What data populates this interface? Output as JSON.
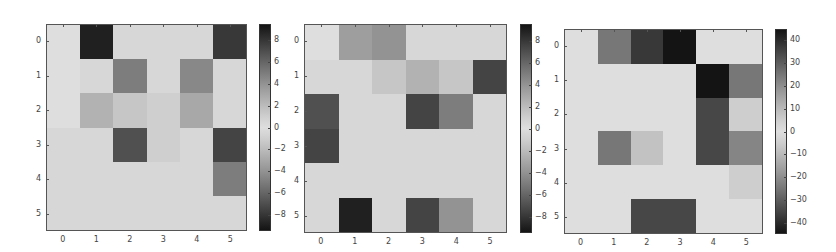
{
  "chart_data": [
    {
      "type": "heatmap",
      "title": "",
      "xlabel": "",
      "ylabel": "",
      "x_ticks": [
        "0",
        "1",
        "2",
        "3",
        "4",
        "5"
      ],
      "y_ticks": [
        "0",
        "1",
        "2",
        "3",
        "4",
        "5"
      ],
      "colormap": "diverging gray (dark at extremes, light near zero)",
      "vmin": -9.5,
      "vmax": 9.5,
      "colorbar_ticks": [
        8,
        6,
        4,
        2,
        0,
        -2,
        -4,
        -6,
        -8
      ],
      "values": [
        [
          0,
          9,
          0.5,
          0.5,
          0.5,
          8
        ],
        [
          0,
          0.5,
          5,
          0.5,
          4.5,
          0.5
        ],
        [
          0,
          2.5,
          1.5,
          1,
          3,
          0.5
        ],
        [
          0.5,
          0.5,
          7,
          1,
          0.5,
          7.5
        ],
        [
          0.5,
          0.5,
          0.5,
          0.5,
          0.5,
          5
        ],
        [
          0.5,
          0.5,
          0.5,
          0.5,
          0.5,
          0.5
        ]
      ],
      "frame": {
        "x": 46,
        "y": 24,
        "w": 201,
        "h": 207
      },
      "colorbar": {
        "x": 259,
        "y": 24,
        "w": 12,
        "h": 207
      }
    },
    {
      "type": "heatmap",
      "title": "",
      "xlabel": "",
      "ylabel": "",
      "x_ticks": [
        "0",
        "1",
        "2",
        "3",
        "4",
        "5"
      ],
      "y_ticks": [
        "0",
        "1",
        "2",
        "3",
        "4",
        "5"
      ],
      "colormap": "diverging gray (dark at extremes, light near zero)",
      "vmin": -9.5,
      "vmax": 9.5,
      "colorbar_ticks": [
        8,
        6,
        4,
        2,
        0,
        -2,
        -4,
        -6,
        -8
      ],
      "values": [
        [
          0,
          3.5,
          4,
          0.5,
          0.5,
          0.5
        ],
        [
          0.5,
          0.5,
          1.5,
          2.5,
          1.5,
          -7.5
        ],
        [
          -7,
          0.5,
          0.5,
          -7.5,
          -5,
          0.5
        ],
        [
          -7.5,
          0.5,
          0.5,
          0.5,
          0.5,
          0.5
        ],
        [
          0.5,
          0.5,
          0.5,
          0.5,
          0.5,
          0.5
        ],
        [
          0.5,
          -9,
          0.5,
          -7.5,
          -4,
          0.5
        ]
      ],
      "frame": {
        "x": 304,
        "y": 24,
        "w": 203,
        "h": 209
      },
      "colorbar": {
        "x": 520,
        "y": 24,
        "w": 12,
        "h": 209
      }
    },
    {
      "type": "heatmap",
      "title": "",
      "xlabel": "",
      "ylabel": "",
      "x_ticks": [
        "0",
        "1",
        "2",
        "3",
        "4",
        "5"
      ],
      "y_ticks": [
        "0",
        "1",
        "2",
        "3",
        "4",
        "5"
      ],
      "colormap": "diverging gray (dark at extremes, light near zero)",
      "vmin": -45,
      "vmax": 45,
      "colorbar_ticks": [
        40,
        30,
        20,
        10,
        0,
        -10,
        -20,
        -30,
        -40
      ],
      "values": [
        [
          0,
          25,
          38,
          45,
          0,
          0
        ],
        [
          0,
          0,
          0,
          0,
          45,
          25
        ],
        [
          0,
          0,
          0,
          0,
          35,
          5
        ],
        [
          0,
          25,
          -8,
          0,
          35,
          22
        ],
        [
          0,
          0,
          0,
          0,
          0,
          -5
        ],
        [
          0,
          0,
          35,
          35,
          0,
          0
        ]
      ],
      "frame": {
        "x": 564,
        "y": 29,
        "w": 199,
        "h": 205
      },
      "colorbar": {
        "x": 775,
        "y": 29,
        "w": 12,
        "h": 205
      }
    }
  ]
}
